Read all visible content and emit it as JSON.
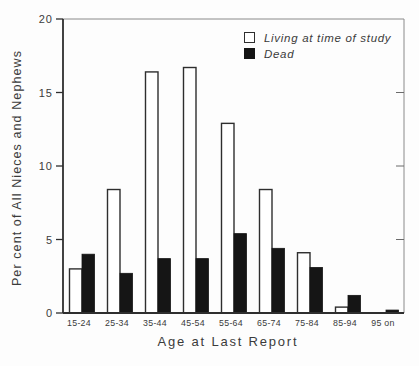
{
  "figure": {
    "background": "#fdfdfd",
    "ink_color": "#2e2e2e",
    "bar_fill_dead": "#151515",
    "bar_fill_living": "#ffffff"
  },
  "chart_data": {
    "type": "bar",
    "title": "",
    "xlabel": "Age at Last Report",
    "ylabel": "Per cent of All Nieces and Nephews",
    "categories": [
      "15-24",
      "25-34",
      "35-44",
      "45-54",
      "55-64",
      "65-74",
      "75-84",
      "85-94",
      "95 on"
    ],
    "series": [
      {
        "name": "Living at time of study",
        "style": "open-outline",
        "color": "#ffffff",
        "values": [
          3.0,
          8.4,
          16.4,
          16.7,
          12.9,
          8.4,
          4.1,
          0.4,
          0
        ]
      },
      {
        "name": "Dead",
        "style": "solid",
        "color": "#151515",
        "values": [
          4.0,
          2.7,
          3.7,
          3.7,
          5.4,
          4.4,
          3.1,
          1.2,
          0.2
        ]
      }
    ],
    "ylim": [
      0,
      20
    ],
    "yticks": [
      0,
      5,
      10,
      15,
      20
    ],
    "right_side_ticks": [
      5,
      10,
      15
    ],
    "grid": false,
    "legend_position": "inside-top-right"
  }
}
